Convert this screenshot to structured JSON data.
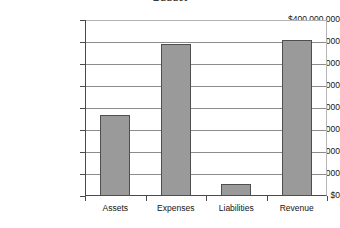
{
  "chart_data": {
    "type": "bar",
    "title": "Budget",
    "subtitle": "",
    "xlabel": "",
    "ylabel": "",
    "categories": [
      "Assets",
      "Expenses",
      "Liabilities",
      "Revenue"
    ],
    "values": [
      183000000,
      345000000,
      28000000,
      355000000
    ],
    "series": [
      {
        "name": "Amount",
        "values": [
          183000000,
          345000000,
          28000000,
          355000000
        ]
      }
    ],
    "ylim": [
      0,
      400000000
    ],
    "ytick_values": [
      0,
      50000000,
      100000000,
      150000000,
      200000000,
      250000000,
      300000000,
      350000000,
      400000000
    ],
    "ytick_labels": [
      "$0",
      "$50,000,000",
      "$100,000,000",
      "$150,000,000",
      "$200,000,000",
      "$250,000,000",
      "$300,000,000",
      "$350,000,000",
      "$400,000,000"
    ],
    "grid": true,
    "legend": false,
    "legend_position": "none",
    "bar_color": "#9a9a9a",
    "bar_border_color": "#4f4f4f",
    "gridline_color": "#8c8c8c",
    "axis_color": "#4a4a4a",
    "background_color": "#ffffff"
  }
}
